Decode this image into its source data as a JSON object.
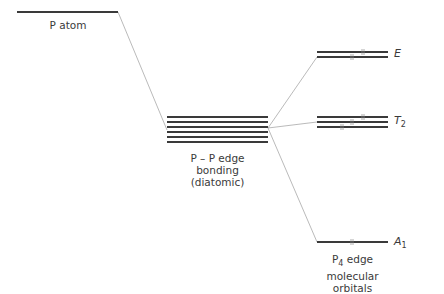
{
  "diagram": {
    "type": "molecular-orbital-energy-level-diagram",
    "columns": [
      {
        "id": "atom",
        "label": "P atom",
        "levels": 1
      },
      {
        "id": "diatomic",
        "label_lines": [
          "P – P edge",
          "bonding",
          "(diatomic)"
        ],
        "levels": 6
      },
      {
        "id": "p4",
        "label_lines": [
          "P",
          "4",
          " edge",
          "molecular",
          "orbitals"
        ],
        "levels_by_symmetry": [
          {
            "symmetry": "E",
            "symbol": "E",
            "subscript": "",
            "count": 2
          },
          {
            "symmetry": "T2",
            "symbol": "T",
            "subscript": "2",
            "count": 3
          },
          {
            "symmetry": "A1",
            "symbol": "A",
            "subscript": "1",
            "count": 1
          }
        ]
      }
    ],
    "labels": {
      "atom": "P atom",
      "diatomic_line1": "P – P edge",
      "diatomic_line2": "bonding",
      "diatomic_line3": "(diatomic)",
      "p4_prefix": "P",
      "p4_sub": "4",
      "p4_suffix": " edge",
      "p4_line2": "molecular",
      "p4_line3": "orbitals",
      "E": "E",
      "T_base": "T",
      "T_sub": "2",
      "A_base": "A",
      "A_sub": "1"
    },
    "colors": {
      "level_line": "#3a3a3a",
      "connector": "#a8a8a8",
      "text": "#3a3a3a"
    }
  }
}
